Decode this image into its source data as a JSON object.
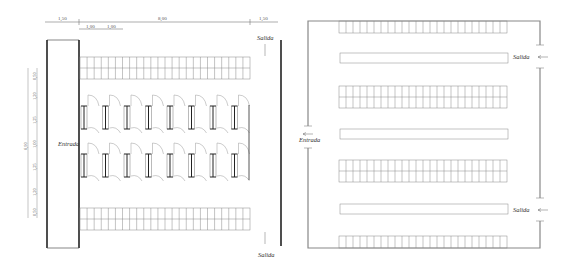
{
  "left_plan": {
    "name": "Parking layout with angled bays (plan A)",
    "labels": {
      "entrance": "Entrada",
      "exit_top": "Salida",
      "exit_bottom": "Salida"
    },
    "horizontal_dimensions": {
      "left_margin": "1,50",
      "main_width": "8,00",
      "right_margin": "1,50",
      "module_1": "1,00",
      "module_2": "1,00"
    },
    "vertical_dimensions": {
      "total": "6,90",
      "segments": [
        "0,50",
        "1,20",
        "1,25",
        "1,00",
        "1,25",
        "1,20",
        "0,50"
      ]
    },
    "grid_rows": {
      "columns": 24,
      "rows": 2,
      "count": 2
    },
    "stall_units_per_row": 8,
    "stall_rows": 2
  },
  "right_plan": {
    "name": "Parking layout with straight rows (plan B)",
    "labels": {
      "entrance": "Entrada",
      "exit_upper": "Salida",
      "exit_lower": "Salida"
    },
    "rows": [
      {
        "type": "grid",
        "columns": 24,
        "rows": 1
      },
      {
        "type": "divider"
      },
      {
        "type": "grid",
        "columns": 24,
        "rows": 2
      },
      {
        "type": "divider"
      },
      {
        "type": "grid",
        "columns": 24,
        "rows": 2
      },
      {
        "type": "divider"
      },
      {
        "type": "grid",
        "columns": 24,
        "rows": 1
      }
    ]
  },
  "colors": {
    "line": "#8a8a8a",
    "heavy_line": "#222222",
    "text": "#333333"
  }
}
